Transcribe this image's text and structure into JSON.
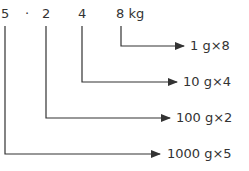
{
  "digits": {
    "d1": "5",
    "dot": "·",
    "d2": "2",
    "d3": "4",
    "d4": "8 kg"
  },
  "labels": {
    "row1": "1 g×8",
    "row2": "10 g×4",
    "row3": "100 g×2",
    "row4": "1000 g×5"
  },
  "colors": {
    "line": "#333333",
    "text": "#333333"
  }
}
